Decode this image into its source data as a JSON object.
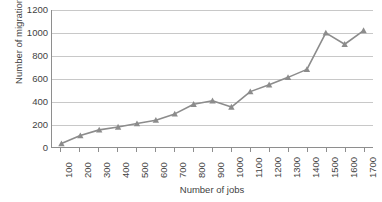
{
  "chart_data": {
    "type": "line",
    "title": "",
    "xlabel": "Number of jobs",
    "ylabel": "Number of migrations",
    "x": [
      100,
      200,
      300,
      400,
      500,
      600,
      700,
      800,
      900,
      1000,
      1100,
      1200,
      1300,
      1400,
      1500,
      1600,
      1700
    ],
    "values": [
      30,
      100,
      150,
      175,
      205,
      235,
      290,
      375,
      405,
      350,
      485,
      545,
      610,
      680,
      1000,
      900,
      1020
    ],
    "series": [
      {
        "name": "Number of migrations",
        "values": [
          30,
          100,
          150,
          175,
          205,
          235,
          290,
          375,
          405,
          350,
          485,
          545,
          610,
          680,
          1000,
          900,
          1020
        ]
      }
    ],
    "xlim": [
      100,
      1700
    ],
    "ylim": [
      0,
      1200
    ],
    "y_ticks": [
      0,
      200,
      400,
      600,
      800,
      1000,
      1200
    ],
    "x_ticks": [
      100,
      200,
      300,
      400,
      500,
      600,
      700,
      800,
      900,
      1000,
      1100,
      1200,
      1300,
      1400,
      1500,
      1600,
      1700
    ],
    "y_tick_labels": [
      "0",
      "200",
      "400",
      "600",
      "800",
      "1000",
      "1200"
    ],
    "x_tick_labels": [
      "100",
      "200",
      "300",
      "400",
      "500",
      "600",
      "700",
      "800",
      "900",
      "1000",
      "1100",
      "1200",
      "1300",
      "1400",
      "1500",
      "1600",
      "1700"
    ],
    "grid": true,
    "grid_axis": "y",
    "legend": false,
    "legend_position": "none",
    "marker": "triangle",
    "colors": {
      "line": "#8c8c8c",
      "marker": "#8c8c8c",
      "grid": "#c8c8c8",
      "axis": "#8e8e8e",
      "text": "#3f3f3f",
      "background": "#ffffff"
    }
  }
}
